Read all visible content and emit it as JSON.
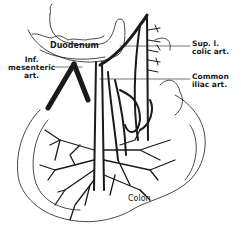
{
  "figure": {
    "colors": {
      "ink": "#1a1a1a",
      "background": "#ffffff"
    },
    "labels": {
      "duodenum": "Duodenum",
      "inf_mesenteric": [
        "Inf.",
        "mesenteric",
        "art."
      ],
      "sup_colic": [
        "Sup. l.",
        "colic art."
      ],
      "common_iliac": [
        "Common",
        "iliac art."
      ],
      "colon": "Colon"
    }
  }
}
